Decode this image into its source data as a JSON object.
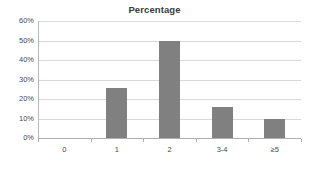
{
  "chart_data": {
    "type": "bar",
    "title": "Percentage",
    "xlabel": "",
    "ylabel": "",
    "categories": [
      "0",
      "1",
      "2",
      "3-4",
      "≥5"
    ],
    "values": [
      0,
      25.5,
      49.5,
      16,
      10
    ],
    "ytick_labels": [
      "0%",
      "10%",
      "20%",
      "30%",
      "40%",
      "50%",
      "60%"
    ],
    "ytick_values": [
      0,
      10,
      20,
      30,
      40,
      50,
      60
    ],
    "ylim": [
      0,
      60
    ],
    "grid": true,
    "legend": false,
    "bar_color": "#808080",
    "gridline_color": "#d9d9d9",
    "axis_color": "#b0b0b0",
    "text_color": "#4a4a4a",
    "title_color": "#3a3a3a",
    "background": "#ffffff"
  }
}
